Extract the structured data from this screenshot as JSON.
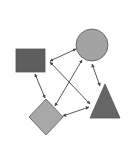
{
  "diagram": {
    "background": "#ffffff",
    "stroke_color": "#555555",
    "arrow_color": "#444444",
    "nodes": [
      {
        "id": "square",
        "shape": "rectangle",
        "x": 16,
        "y": 49,
        "width": 29,
        "height": 23,
        "fill": "#5e5e5e"
      },
      {
        "id": "circle",
        "shape": "circle",
        "cx": 92,
        "cy": 45,
        "r": 16,
        "fill": "#a3a3a3"
      },
      {
        "id": "triangle",
        "shape": "triangle",
        "points": "105,84 120,118 90,118",
        "fill": "#666666"
      },
      {
        "id": "diamond",
        "shape": "diamond",
        "points": "46,99 63,117 46,135 29,117",
        "fill": "#a8a8a8"
      }
    ],
    "edges": [
      {
        "from": "circle",
        "to": "square-right",
        "x1": 76,
        "y1": 49,
        "x2": 50,
        "y2": 61
      },
      {
        "from": "square-right",
        "to": "triangle",
        "x1": 50,
        "y1": 62,
        "x2": 90,
        "y2": 104
      },
      {
        "from": "circle",
        "to": "diamond",
        "x1": 82,
        "y1": 60,
        "x2": 55,
        "y2": 106
      },
      {
        "from": "square",
        "to": "diamond",
        "x1": 35,
        "y1": 74,
        "x2": 45,
        "y2": 98
      },
      {
        "from": "circle",
        "to": "triangle",
        "x1": 92,
        "y1": 64,
        "x2": 100,
        "y2": 86
      },
      {
        "from": "triangle",
        "to": "diamond",
        "x1": 89,
        "y1": 107,
        "x2": 63,
        "y2": 116
      }
    ]
  }
}
